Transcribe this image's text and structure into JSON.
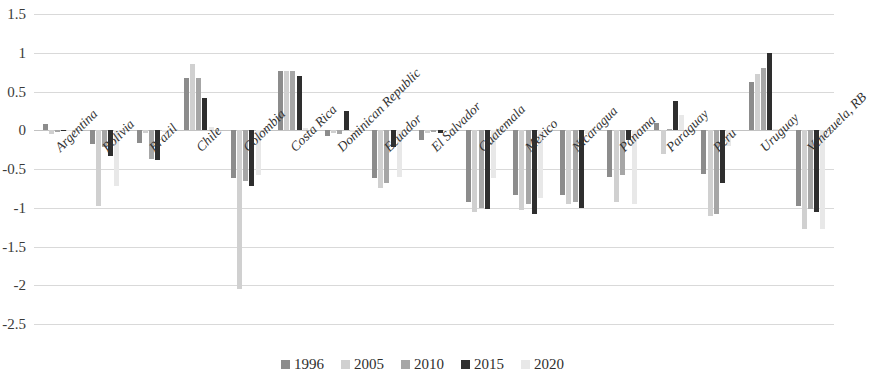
{
  "chart_data": {
    "type": "bar",
    "title": "",
    "subtitle": "",
    "xlabel": "",
    "ylabel": "",
    "ylim": [
      -2.5,
      1.5
    ],
    "ytick_labels": [
      "1.5",
      "1",
      "0.5",
      "0",
      "-0.5",
      "-1",
      "-1.5",
      "-2",
      "-2.5"
    ],
    "ytick_values": [
      1.5,
      1,
      0.5,
      0,
      -0.5,
      -1,
      -1.5,
      -2,
      -2.5
    ],
    "grid": true,
    "legend_position": "bottom",
    "categories": [
      "Argentina",
      "Bolivia",
      "Brazil",
      "Chile",
      "Colombia",
      "Costa Rica",
      "Dominican Republic",
      "Ecuador",
      "El Salvador",
      "Guatemala",
      "Mexico",
      "Nicaragua",
      "Panama",
      "Paraguay",
      "Peru",
      "Uruguay",
      "Venezuela, RB"
    ],
    "series": [
      {
        "name": "1996",
        "color": "#8c8c8c",
        "values": [
          0.08,
          -0.18,
          -0.17,
          0.67,
          -0.62,
          0.76,
          -0.07,
          -0.62,
          -0.12,
          -0.92,
          -0.83,
          -0.83,
          -0.6,
          0.1,
          -0.57,
          0.62,
          -0.98
        ]
      },
      {
        "name": "2005",
        "color": "#d0d0d0",
        "values": [
          -0.05,
          -0.98,
          -0.04,
          0.85,
          -2.05,
          0.76,
          -0.03,
          -0.75,
          -0.04,
          -1.05,
          -1.03,
          -0.95,
          -0.92,
          -0.3,
          -1.1,
          0.73,
          -1.28
        ]
      },
      {
        "name": "2010",
        "color": "#a6a6a6",
        "values": [
          -0.02,
          -0.22,
          -0.37,
          0.67,
          -0.65,
          0.76,
          -0.05,
          -0.68,
          -0.02,
          -1.0,
          -0.95,
          -0.92,
          -0.58,
          0.02,
          -1.08,
          0.8,
          -1.02
        ]
      },
      {
        "name": "2015",
        "color": "#2e2e2e",
        "values": [
          0.0,
          -0.33,
          -0.38,
          0.42,
          -0.72,
          0.7,
          0.25,
          -0.22,
          -0.03,
          -1.02,
          -1.08,
          -1.0,
          -0.13,
          0.38,
          -0.68,
          1.0,
          -1.05
        ]
      },
      {
        "name": "2020",
        "color": "#e8e8e8",
        "values": [
          -0.01,
          -0.72,
          -0.02,
          0.04,
          -0.58,
          0.03,
          -0.02,
          -0.6,
          -0.01,
          -0.62,
          -0.88,
          -0.05,
          -0.95,
          0.2,
          -0.2,
          0.02,
          -1.28
        ]
      }
    ]
  },
  "legend": {
    "items": [
      {
        "label": "1996",
        "color": "#8c8c8c"
      },
      {
        "label": "2005",
        "color": "#d0d0d0"
      },
      {
        "label": "2010",
        "color": "#a6a6a6"
      },
      {
        "label": "2015",
        "color": "#2e2e2e"
      },
      {
        "label": "2020",
        "color": "#e8e8e8"
      }
    ]
  }
}
